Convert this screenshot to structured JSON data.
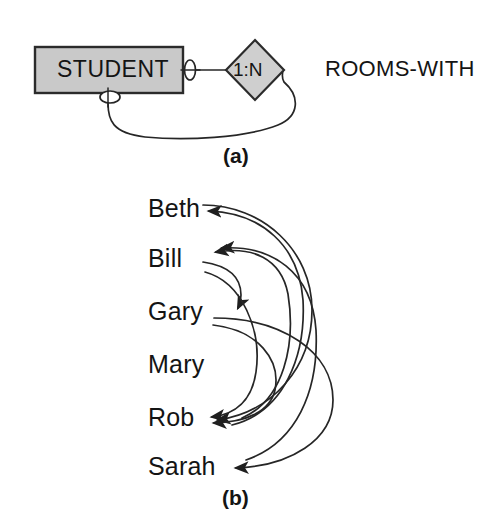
{
  "figure": {
    "caption_a": "(a)",
    "caption_b": "(b)",
    "colors": {
      "entity_fill": "#c9c9c9",
      "diamond_fill": "#cfcfcf",
      "stroke": "#262626",
      "background": "#ffffff",
      "text": "#141414"
    }
  },
  "part_a": {
    "entity": {
      "label": "STUDENT",
      "shape": "rectangle"
    },
    "relationship": {
      "cardinality_label": "1:N",
      "name": "ROOMS-WITH",
      "shape": "diamond",
      "recursive": "true"
    },
    "connectors": [
      {
        "name": "right-cardinality-oval",
        "shape": "ellipse"
      },
      {
        "name": "bottom-cardinality-oval",
        "shape": "ellipse"
      }
    ]
  },
  "part_b": {
    "people": [
      {
        "name": "Beth"
      },
      {
        "name": "Bill"
      },
      {
        "name": "Gary"
      },
      {
        "name": "Mary"
      },
      {
        "name": "Rob"
      },
      {
        "name": "Sarah"
      }
    ],
    "relationship_arcs": [
      {
        "from": "Beth",
        "to": "Rob"
      },
      {
        "from": "Bill",
        "to": "Gary"
      },
      {
        "from": "Bill",
        "to": "Rob"
      },
      {
        "from": "Gary",
        "to": "Rob"
      },
      {
        "from": "Gary",
        "to": "Sarah"
      },
      {
        "from": "Rob",
        "to": "Bill"
      },
      {
        "from": "Rob",
        "to": "Beth"
      },
      {
        "from": "Sarah",
        "to": "Bill"
      }
    ]
  }
}
